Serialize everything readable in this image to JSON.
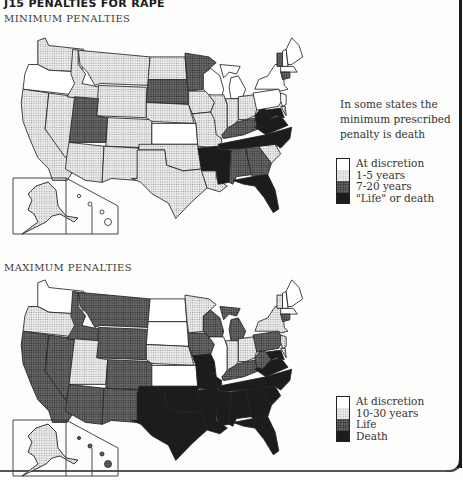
{
  "figure": {
    "title": "J15 PENALTIES FOR RAPE"
  },
  "minimum_map": {
    "title": "MINIMUM PENALTIES",
    "note": "In some states the minimum prescribed penalty is death",
    "legend": [
      {
        "label": "At discretion",
        "fill": "white"
      },
      {
        "label": "1-5 years",
        "fill": "light"
      },
      {
        "label": "7-20 years",
        "fill": "dark"
      },
      {
        "label": "\"Life\" or death",
        "fill": "black"
      }
    ],
    "states": {
      "WA": "light",
      "OR": "white",
      "CA": "light",
      "NV": "light",
      "ID": "light",
      "MT": "light",
      "WY": "light",
      "UT": "dark",
      "CO": "light",
      "AZ": "light",
      "NM": "light",
      "ND": "light",
      "SD": "dark",
      "NE": "light",
      "KS": "white",
      "OK": "light",
      "TX": "light",
      "MN": "dark",
      "IA": "light",
      "MO": "light",
      "AR": "black",
      "LA": "light",
      "WI": "white",
      "MI": "white",
      "IL": "light",
      "IN": "light",
      "OH": "light",
      "KY": "dark",
      "TN": "black",
      "MS": "black",
      "AL": "dark",
      "GA": "dark",
      "FL": "black",
      "SC": "light",
      "NC": "black",
      "VA": "black",
      "WV": "black",
      "PA": "white",
      "NY": "white",
      "VT": "dark",
      "NH": "white",
      "ME": "white",
      "MA": "white",
      "CT": "dark",
      "NJ": "white",
      "DE": "light",
      "MD": "black",
      "AK": "light",
      "HI": "white"
    }
  },
  "maximum_map": {
    "title": "MAXIMUM PENALTIES",
    "legend": [
      {
        "label": "At discretion",
        "fill": "white"
      },
      {
        "label": "10-30 years",
        "fill": "light"
      },
      {
        "label": "Life",
        "fill": "dark"
      },
      {
        "label": "Death",
        "fill": "black"
      }
    ],
    "states": {
      "WA": "white",
      "OR": "light",
      "CA": "dark",
      "NV": "dark",
      "ID": "dark",
      "MT": "dark",
      "WY": "dark",
      "UT": "light",
      "CO": "dark",
      "AZ": "dark",
      "NM": "dark",
      "ND": "white",
      "SD": "white",
      "NE": "light",
      "KS": "white",
      "OK": "black",
      "TX": "black",
      "MN": "light",
      "IA": "dark",
      "MO": "black",
      "AR": "black",
      "LA": "black",
      "WI": "dark",
      "MI": "dark",
      "IL": "white",
      "IN": "light",
      "OH": "light",
      "KY": "dark",
      "TN": "black",
      "MS": "black",
      "AL": "black",
      "GA": "black",
      "FL": "black",
      "SC": "black",
      "NC": "black",
      "VA": "black",
      "WV": "dark",
      "PA": "dark",
      "NY": "light",
      "VT": "light",
      "NH": "white",
      "ME": "white",
      "MA": "white",
      "CT": "dark",
      "NJ": "light",
      "DE": "light",
      "MD": "black",
      "AK": "light",
      "HI": "dark"
    }
  }
}
